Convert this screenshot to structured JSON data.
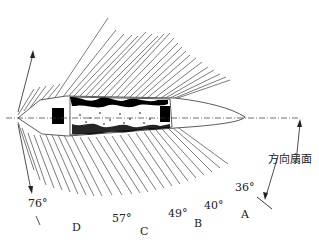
{
  "diagram": {
    "title_label": "方向扇面",
    "angles": [
      {
        "id": "a76",
        "text": "76°"
      },
      {
        "id": "a57",
        "text": "57°"
      },
      {
        "id": "a49",
        "text": "49°"
      },
      {
        "id": "a40",
        "text": "40°"
      },
      {
        "id": "a36",
        "text": "36°"
      }
    ],
    "zones": [
      {
        "id": "D",
        "text": "D"
      },
      {
        "id": "C",
        "text": "C"
      },
      {
        "id": "B",
        "text": "B"
      },
      {
        "id": "A",
        "text": "A"
      }
    ],
    "colors": {
      "line": "#333333",
      "fill": "#000000",
      "background": "#ffffff"
    }
  }
}
